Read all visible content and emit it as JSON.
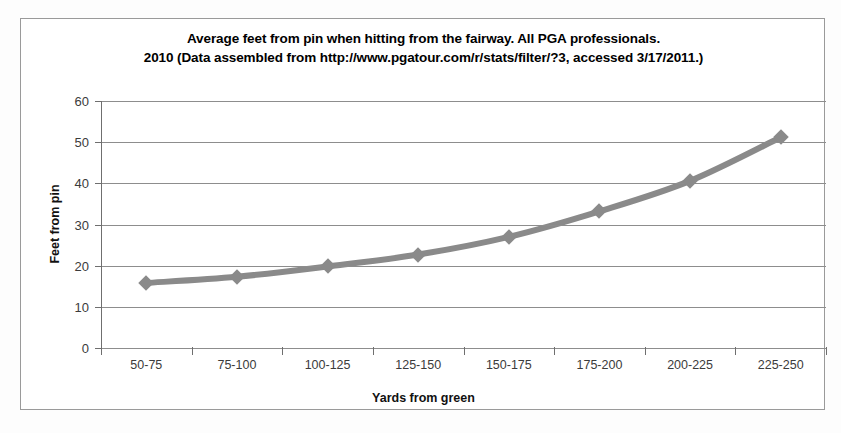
{
  "chart_data": {
    "type": "line",
    "title": "Average feet from pin when hitting from the fairway. All PGA professionals.\n2010 (Data assembled from http://www.pgatour.com/r/stats/filter/?3, accessed 3/17/2011.)",
    "title_lines": [
      "Average feet from pin when hitting from the fairway. All PGA professionals.",
      "2010 (Data assembled from http://www.pgatour.com/r/stats/filter/?3, accessed 3/17/2011.)"
    ],
    "xlabel": "Yards from green",
    "ylabel": "Feet from pin",
    "categories": [
      "50-75",
      "75-100",
      "100-125",
      "125-150",
      "150-175",
      "175-200",
      "200-225",
      "225-250"
    ],
    "values": [
      15.8,
      17.3,
      19.8,
      22.7,
      27.0,
      33.2,
      40.6,
      51.2
    ],
    "ylim": [
      0,
      60
    ],
    "yticks": [
      0,
      10,
      20,
      30,
      40,
      50,
      60
    ],
    "ytick_labels": [
      "0",
      "10",
      "20",
      "30",
      "40",
      "50",
      "60"
    ],
    "grid": true,
    "grid_axis": "y",
    "legend": false,
    "series_color": "#8a8a8a",
    "marker": "diamond",
    "line_width": 6
  },
  "figure": {
    "border_color": "#9a9a9a",
    "background": "#ffffff",
    "grid_color": "#8d8d8d",
    "axis_color": "#6f6f6f",
    "tick_label_color": "#3b3b3b"
  }
}
